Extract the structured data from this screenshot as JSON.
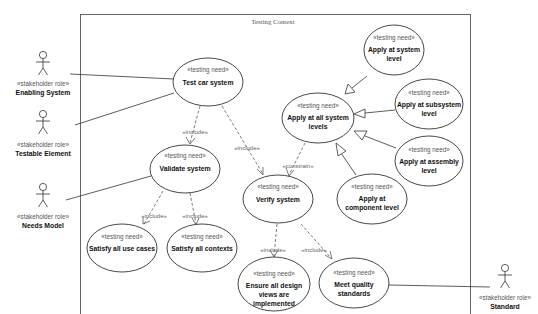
{
  "diagram": {
    "type": "uml-use-case",
    "boundary": {
      "title": "Testing Context"
    },
    "use_cases": [
      {
        "id": "test-car-system",
        "stereotype": "«testing need»",
        "lines": [
          "Test car system"
        ]
      },
      {
        "id": "validate-system",
        "stereotype": "«testing need»",
        "lines": [
          "Validate system"
        ]
      },
      {
        "id": "verify-system",
        "stereotype": "«testing need»",
        "lines": [
          "Verify system"
        ]
      },
      {
        "id": "apply-all-levels",
        "stereotype": "«testing need»",
        "lines": [
          "Apply at all system",
          "levels"
        ]
      },
      {
        "id": "apply-system-level",
        "stereotype": "«testing need»",
        "lines": [
          "Apply at system",
          "level"
        ]
      },
      {
        "id": "apply-subsystem-level",
        "stereotype": "«testing need»",
        "lines": [
          "Apply at subsystem",
          "level"
        ]
      },
      {
        "id": "apply-assembly-level",
        "stereotype": "«testing need»",
        "lines": [
          "Apply at assembly",
          "level"
        ]
      },
      {
        "id": "apply-component-level",
        "stereotype": "«testing need»",
        "lines": [
          "Apply at",
          "component level"
        ]
      },
      {
        "id": "satisfy-use-cases",
        "stereotype": "«testing need»",
        "lines": [
          "Satisfy all use cases"
        ]
      },
      {
        "id": "satisfy-contexts",
        "stereotype": "«testing need»",
        "lines": [
          "Satisfy all contexts"
        ]
      },
      {
        "id": "ensure-design-views",
        "stereotype": "«testing need»",
        "lines": [
          "Ensure all design",
          "views are",
          "implemented"
        ]
      },
      {
        "id": "meet-quality",
        "stereotype": "«testing need»",
        "lines": [
          "Meet quality",
          "standards"
        ]
      }
    ],
    "actors": [
      {
        "id": "enabling-system",
        "stereotype": "«stakeholder role»",
        "name": "Enabling System"
      },
      {
        "id": "testable-element",
        "stereotype": "«stakeholder role»",
        "name": "Testable Element"
      },
      {
        "id": "needs-model",
        "stereotype": "«stakeholder role»",
        "name": "Needs Model"
      },
      {
        "id": "standard",
        "stereotype": "«stakeholder role»",
        "name": "Standard"
      }
    ],
    "relationships": [
      {
        "from": "enabling-system",
        "to": "test-car-system",
        "kind": "association"
      },
      {
        "from": "testable-element",
        "to": "test-car-system",
        "kind": "association"
      },
      {
        "from": "needs-model",
        "to": "validate-system",
        "kind": "association"
      },
      {
        "from": "standard",
        "to": "meet-quality",
        "kind": "association"
      },
      {
        "from": "test-car-system",
        "to": "validate-system",
        "kind": "dependency",
        "label": "«include»"
      },
      {
        "from": "test-car-system",
        "to": "verify-system",
        "kind": "dependency",
        "label": "«include»"
      },
      {
        "from": "validate-system",
        "to": "satisfy-use-cases",
        "kind": "dependency",
        "label": "«include»"
      },
      {
        "from": "validate-system",
        "to": "satisfy-contexts",
        "kind": "dependency",
        "label": "«include»"
      },
      {
        "from": "apply-all-levels",
        "to": "verify-system",
        "kind": "dependency",
        "label": "«constrain»"
      },
      {
        "from": "verify-system",
        "to": "ensure-design-views",
        "kind": "dependency",
        "label": "«include»"
      },
      {
        "from": "verify-system",
        "to": "meet-quality",
        "kind": "dependency",
        "label": "«include»"
      },
      {
        "from": "apply-system-level",
        "to": "apply-all-levels",
        "kind": "generalization"
      },
      {
        "from": "apply-subsystem-level",
        "to": "apply-all-levels",
        "kind": "generalization"
      },
      {
        "from": "apply-assembly-level",
        "to": "apply-all-levels",
        "kind": "generalization"
      },
      {
        "from": "apply-component-level",
        "to": "apply-all-levels",
        "kind": "generalization"
      }
    ]
  },
  "labels": {
    "title": "Testing Context",
    "stereo_uc": "«testing need»",
    "stereo_actor": "«stakeholder role»",
    "include": "«include»",
    "constrain": "«constrain»",
    "uc": {
      "test_car": "Test car system",
      "validate": "Validate system",
      "verify": "Verify system",
      "all_levels_1": "Apply at all system",
      "all_levels_2": "levels",
      "sys_1": "Apply at system",
      "sys_2": "level",
      "sub_1": "Apply at subsystem",
      "sub_2": "level",
      "asm_1": "Apply at assembly",
      "asm_2": "level",
      "comp_1": "Apply at",
      "comp_2": "component level",
      "use_cases": "Satisfy all use cases",
      "contexts": "Satisfy all contexts",
      "ensure_1": "Ensure all design",
      "ensure_2": "views are",
      "ensure_3": "implemented",
      "quality_1": "Meet quality",
      "quality_2": "standards"
    },
    "actor": {
      "enabling": "Enabling System",
      "testable": "Testable Element",
      "needs": "Needs Model",
      "standard": "Standard"
    }
  }
}
